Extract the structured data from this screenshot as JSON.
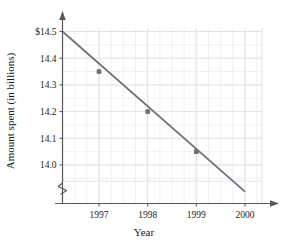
{
  "chart_data": {
    "type": "line",
    "title": "",
    "xlabel": "Year",
    "ylabel": "Amount spent (in billions)",
    "x": [
      1997,
      1998,
      1999
    ],
    "values": [
      14.35,
      14.2,
      14.05
    ],
    "series": [
      {
        "name": "Amount spent",
        "x": [
          1997,
          1998,
          1999
        ],
        "values": [
          14.35,
          14.2,
          14.05
        ]
      }
    ],
    "trendline": {
      "x_start": 1996.25,
      "y_start": 14.5,
      "x_end": 2000.0,
      "y_end": 13.9,
      "slope_per_year": -0.15
    },
    "xlim": [
      1996.25,
      2000.35
    ],
    "ylim": [
      13.88,
      14.55
    ],
    "xticks": [
      1997,
      1998,
      1999,
      2000
    ],
    "xtick_labels": [
      "1997",
      "1998",
      "1999",
      "2000"
    ],
    "yticks": [
      14.0,
      14.1,
      14.2,
      14.3,
      14.4,
      14.5
    ],
    "ytick_labels": [
      "14.0",
      "14.1",
      "14.2",
      "14.3",
      "14.4",
      "$14.5"
    ],
    "grid": true,
    "grid_minor": true,
    "legend": "none",
    "y_axis_break": true,
    "marker": "square",
    "line_color": "#6e6e73",
    "marker_color": "#6e6e73",
    "grid_color": "#e2e2ea",
    "grid_minor_color": "#f0f0f4",
    "axis_color": "#58585c"
  },
  "axes": {
    "y_title": "Amount spent (in billions)",
    "x_title": "Year"
  },
  "y_ticks": [
    {
      "label": "$14.5",
      "value": 14.5
    },
    {
      "label": "14.4",
      "value": 14.4
    },
    {
      "label": "14.3",
      "value": 14.3
    },
    {
      "label": "14.2",
      "value": 14.2
    },
    {
      "label": "14.1",
      "value": 14.1
    },
    {
      "label": "14.0",
      "value": 14.0
    }
  ],
  "x_ticks": [
    {
      "label": "1997",
      "value": 1997
    },
    {
      "label": "1998",
      "value": 1998
    },
    {
      "label": "1999",
      "value": 1999
    },
    {
      "label": "2000",
      "value": 2000
    }
  ],
  "icons": {
    "y_axis_arrow": "arrow-up-icon",
    "x_axis_arrow": "arrow-right-icon",
    "axis_break": "axis-break-zigzag-icon"
  }
}
